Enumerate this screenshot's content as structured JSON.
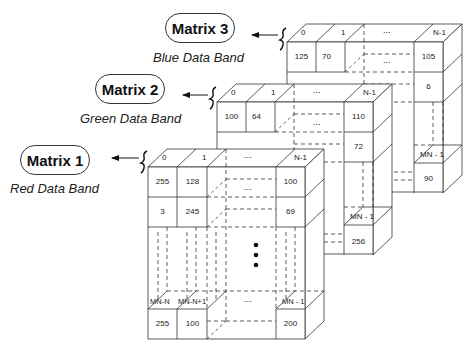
{
  "matrices": [
    {
      "label": "Matrix 3",
      "band": "Blue Data Band",
      "headers": [
        "0",
        "1",
        "...",
        "N-1"
      ],
      "row1": [
        "125",
        "70",
        "...",
        "105"
      ],
      "row2_last": "6",
      "last_header": "MN - 1",
      "last_value": "90"
    },
    {
      "label": "Matrix 2",
      "band": "Green Data Band",
      "headers": [
        "0",
        "1",
        "...",
        "N-1"
      ],
      "row1": [
        "100",
        "64",
        "...",
        "110"
      ],
      "row2_last": "72",
      "last_header": "MN - 1",
      "last_value": "256"
    },
    {
      "label": "Matrix 1",
      "band": "Red Data Band",
      "headers": [
        "0",
        "1",
        "...",
        "N-1"
      ],
      "row1": [
        "255",
        "128",
        "...",
        "100"
      ],
      "row2": [
        "3",
        "245",
        "...",
        "69"
      ],
      "bottom_headers": [
        "MN-N",
        "MN-N+1",
        "...",
        "MN - 1"
      ],
      "bottom_values": [
        "255",
        "100",
        "",
        "200"
      ]
    }
  ],
  "colors": {
    "line": "#333333",
    "background": "#ffffff"
  }
}
